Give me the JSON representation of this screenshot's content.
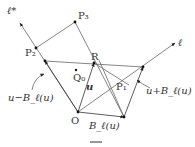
{
  "figure": {
    "type": "geometric vector diagram",
    "colors": {
      "line": "#555555",
      "point": "#111111",
      "text": "#333333",
      "background": "#ffffff"
    }
  },
  "labels": {
    "ell_star": "ℓ*",
    "ell": "ℓ",
    "P3": "P₃",
    "P2": "P₂",
    "R": "R",
    "Q0": "Q₀",
    "u": "u",
    "P1": "P₁",
    "O": "O",
    "u_minus_B": "u−B_ℓ(u)",
    "u_plus_B": "u+B_ℓ(u)",
    "B": "B_ℓ(u)",
    "caption_mark": "—"
  },
  "points": {
    "O": [
      78,
      112
    ],
    "B_end": [
      124,
      117
    ],
    "R": [
      94,
      63
    ],
    "U_plus_B": [
      143,
      67
    ],
    "U_minus_B": [
      45,
      61
    ],
    "P1": [
      129,
      85
    ],
    "P2": [
      36,
      48
    ],
    "P3": [
      75,
      22
    ],
    "Q0": [
      76,
      70
    ],
    "ell_end": [
      175,
      43
    ],
    "ell_star_end": [
      20,
      23
    ]
  }
}
